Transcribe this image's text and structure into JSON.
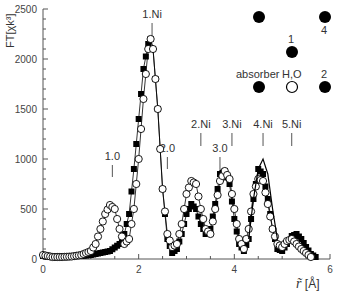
{
  "chart_data": {
    "type": "line",
    "title": "",
    "xlabel": "r̃ [Å]",
    "ylabel": "FT[χk³]",
    "xlim": [
      0,
      6
    ],
    "ylim": [
      0,
      2500
    ],
    "x_ticks": [
      "0",
      "2",
      "4",
      "6"
    ],
    "y_ticks": [
      "0",
      "500",
      "1000",
      "1500",
      "2000",
      "2500"
    ],
    "grid": false,
    "series": [
      {
        "name": "experiment (filled squares)",
        "marker": "filled-square",
        "x": [
          0.0,
          0.2,
          0.4,
          0.6,
          0.8,
          1.0,
          1.2,
          1.4,
          1.6,
          1.7,
          1.8,
          1.9,
          2.0,
          2.1,
          2.2,
          2.25,
          2.3,
          2.4,
          2.5,
          2.6,
          2.7,
          2.8,
          2.9,
          3.0,
          3.1,
          3.2,
          3.3,
          3.4,
          3.5,
          3.6,
          3.7,
          3.8,
          3.9,
          4.0,
          4.1,
          4.2,
          4.3,
          4.4,
          4.5,
          4.6,
          4.7,
          4.8,
          4.9,
          5.0,
          5.1,
          5.2,
          5.3,
          5.4,
          5.5,
          5.6,
          5.7
        ],
        "y": [
          30,
          20,
          25,
          30,
          30,
          40,
          60,
          80,
          150,
          250,
          450,
          900,
          1400,
          1900,
          2150,
          2200,
          2100,
          1500,
          700,
          200,
          60,
          100,
          250,
          450,
          550,
          500,
          350,
          250,
          300,
          550,
          850,
          880,
          750,
          400,
          150,
          80,
          200,
          600,
          900,
          850,
          600,
          300,
          100,
          80,
          150,
          230,
          250,
          200,
          120,
          50,
          20
        ]
      },
      {
        "name": "fit (open circles)",
        "marker": "open-circle",
        "x": [
          0.0,
          0.2,
          0.4,
          0.6,
          0.8,
          1.0,
          1.1,
          1.2,
          1.3,
          1.4,
          1.5,
          1.6,
          1.7,
          1.8,
          1.9,
          2.0,
          2.1,
          2.2,
          2.25,
          2.3,
          2.4,
          2.5,
          2.6,
          2.7,
          2.8,
          2.9,
          3.0,
          3.1,
          3.2,
          3.3,
          3.4,
          3.5,
          3.6,
          3.7,
          3.8,
          3.9,
          4.0,
          4.1,
          4.2,
          4.3,
          4.4,
          4.5,
          4.6,
          4.7,
          4.8,
          4.9,
          5.0,
          5.1,
          5.2,
          5.3,
          5.4,
          5.5,
          5.6
        ],
        "y": [
          40,
          20,
          20,
          25,
          40,
          80,
          150,
          300,
          450,
          540,
          500,
          300,
          150,
          200,
          500,
          1000,
          1600,
          2100,
          2200,
          2100,
          1500,
          700,
          250,
          120,
          150,
          350,
          650,
          780,
          750,
          500,
          300,
          250,
          500,
          780,
          880,
          800,
          500,
          200,
          100,
          300,
          650,
          800,
          780,
          550,
          300,
          150,
          120,
          180,
          200,
          150,
          100,
          60,
          20
        ]
      },
      {
        "name": "thin line (simulation)",
        "marker": "none",
        "x": [
          4.3,
          4.4,
          4.5,
          4.6,
          4.7,
          4.8,
          4.9
        ],
        "y": [
          200,
          600,
          900,
          1000,
          850,
          500,
          200
        ]
      }
    ],
    "annotations": [
      {
        "text": "1.Ni",
        "x": 2.28,
        "type": "shell-marker"
      },
      {
        "text": "2.Ni",
        "x": 3.3,
        "type": "shell-marker"
      },
      {
        "text": "3.Ni",
        "x": 3.95,
        "type": "shell-marker"
      },
      {
        "text": "4.Ni",
        "x": 4.6,
        "type": "shell-marker"
      },
      {
        "text": "5.Ni",
        "x": 5.2,
        "type": "shell-marker"
      },
      {
        "text": "1.0",
        "x": 1.45,
        "type": "distance-marker"
      },
      {
        "text": "2.0",
        "x": 2.6,
        "type": "distance-marker"
      },
      {
        "text": "3.0",
        "x": 3.7,
        "type": "distance-marker"
      }
    ],
    "inset": {
      "labels": [
        "1",
        "4",
        "absorber",
        "H,O",
        "2"
      ]
    }
  },
  "axes": {
    "ylabel": "FT[χk³]",
    "xlabel_symbol": "r̃",
    "xlabel_unit": "[Å]"
  },
  "markers": {
    "shell": [
      "1.Ni",
      "2.Ni",
      "3.Ni",
      "4.Ni",
      "5.Ni"
    ],
    "distance": [
      "1.0",
      "2.0",
      "3.0"
    ]
  },
  "inset": {
    "label_1": "1",
    "label_4": "4",
    "label_absorber": "absorber",
    "label_h2o": "H,O",
    "label_2": "2"
  }
}
